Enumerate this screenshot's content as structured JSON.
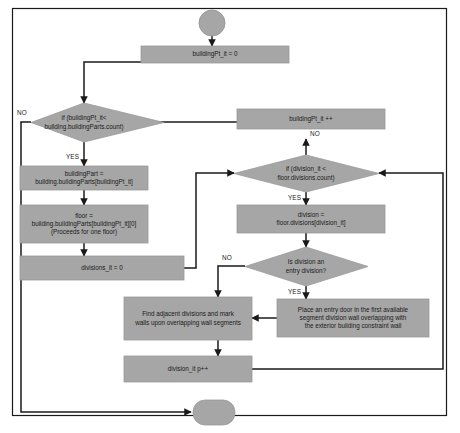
{
  "diagram": {
    "type": "flowchart",
    "canvas": {
      "width": 460,
      "height": 433
    },
    "style": {
      "node_fill": "#a6a6a6",
      "node_stroke": "#8c8c8c",
      "edge_color": "#1a1a1a",
      "frame_color": "#1a1a1a",
      "text_color": "#1a1a1a",
      "background": "#ffffff"
    },
    "nodes": [
      {
        "id": "start",
        "shape": "circle",
        "label": ""
      },
      {
        "id": "init_bpt",
        "shape": "process",
        "label": "buildingPt_it = 0"
      },
      {
        "id": "cond_bpt",
        "shape": "decision",
        "label": "if (buildingPt_it<\nbuilding.buildingParts.count)"
      },
      {
        "id": "bpt_inc",
        "shape": "process",
        "label": "buildingPt_it ++"
      },
      {
        "id": "building_part",
        "shape": "process",
        "label": "buildingPart =\nbuilding.buildingParts[buildingPt_it]"
      },
      {
        "id": "floor",
        "shape": "process",
        "label": "floor =\nbuilding.buildingParts[buildingPt_it][0]\n(Proceeds for one floor)"
      },
      {
        "id": "div_init",
        "shape": "process",
        "label": "divisions_it = 0"
      },
      {
        "id": "cond_div",
        "shape": "decision",
        "label": "if (division_it <\nfloor.divisions.count)"
      },
      {
        "id": "division",
        "shape": "process",
        "label": "division =\nfloor.divisions[division_it]"
      },
      {
        "id": "cond_entry",
        "shape": "decision",
        "label": "Is division an\nentry division?"
      },
      {
        "id": "place_door",
        "shape": "process",
        "label": "Place an entry door in the first available\nsegment division wall overlapping with\nthe exterior building constraint wall"
      },
      {
        "id": "find_adj",
        "shape": "process",
        "label": "Find adjacent divisions and mark\nwalls upon overlapping wall segments"
      },
      {
        "id": "div_inc",
        "shape": "process",
        "label": "division_it p++"
      },
      {
        "id": "end",
        "shape": "terminator",
        "label": ""
      }
    ],
    "edge_labels": [
      {
        "id": "no_bpt",
        "text": "NO",
        "from": "cond_bpt",
        "x": 17,
        "y": 110
      },
      {
        "id": "yes_bpt",
        "text": "YES",
        "from": "cond_bpt",
        "x": 84,
        "y": 159
      },
      {
        "id": "no_div",
        "text": "NO",
        "from": "cond_div",
        "x": 262,
        "y": 137
      },
      {
        "id": "yes_div",
        "text": "YES",
        "from": "cond_div",
        "x": 275,
        "y": 197
      },
      {
        "id": "no_entry",
        "text": "NO",
        "from": "cond_entry",
        "x": 222,
        "y": 255
      },
      {
        "id": "yes_entry",
        "text": "YES",
        "from": "cond_entry",
        "x": 290,
        "y": 290
      }
    ]
  }
}
